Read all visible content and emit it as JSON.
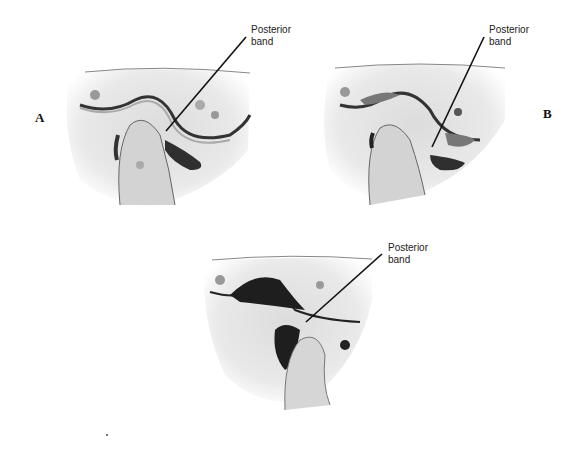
{
  "figure": {
    "panels": [
      {
        "id": "A",
        "letter": "A",
        "label_line1": "Posterior",
        "label_line2": "band"
      },
      {
        "id": "B",
        "letter": "B",
        "label_line1": "Posterior",
        "label_line2": "band"
      },
      {
        "id": "C",
        "letter": "",
        "label_line1": "Posterior",
        "label_line2": "band"
      }
    ]
  },
  "colors": {
    "background": "#ffffff",
    "tissue_light": "#e6e6e6",
    "tissue_mid": "#bdbdbd",
    "tissue_dark": "#2a2a2a",
    "leader_line": "#111111"
  }
}
